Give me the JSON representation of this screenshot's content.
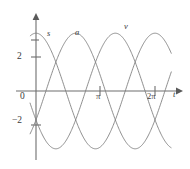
{
  "figure": {
    "title": "",
    "axis": {
      "x_label": "t",
      "y_label": "",
      "x_ticks": [
        {
          "value": "π",
          "pos": 3.14159
        },
        {
          "value": "2π",
          "pos": 6.28318
        }
      ],
      "y_ticks": [
        {
          "value": "2",
          "pos": 2
        },
        {
          "value": "0",
          "pos": 0
        },
        {
          "value": "−2",
          "pos": -2
        }
      ]
    },
    "curve_labels": [
      {
        "name": "s",
        "text": "s"
      },
      {
        "name": "a",
        "text": "a"
      },
      {
        "name": "v",
        "text": "v"
      }
    ],
    "colors": {
      "axis": "#6e6e6e",
      "curve": "#7a7a7a",
      "text": "#3a3a3a",
      "background": "#ffffff"
    }
  },
  "chart_data": {
    "type": "line",
    "title": "",
    "xlabel": "t",
    "ylabel": "",
    "xlim": [
      -0.35,
      7.2
    ],
    "ylim": [
      -4.4,
      4.2
    ],
    "grid": false,
    "legend": "inline-curve-labels",
    "x_tick_values": [
      3.14159,
      6.28318
    ],
    "x_tick_labels": [
      "π",
      "2π"
    ],
    "y_tick_values": [
      2,
      0,
      -2
    ],
    "y_tick_labels": [
      "2",
      "0",
      "−2"
    ],
    "amplitude": 3.4,
    "period": 6.28318,
    "series": [
      {
        "name": "s",
        "label": "s",
        "form": "3.4*cos(t)",
        "phase_deg": 0,
        "x": [
          0,
          0.393,
          0.785,
          1.178,
          1.571,
          1.963,
          2.356,
          2.749,
          3.142,
          3.534,
          3.927,
          4.32,
          4.712,
          5.105,
          5.498,
          5.89,
          6.283,
          6.676,
          7.069
        ],
        "values": [
          3.4,
          3.14,
          2.4,
          1.3,
          0,
          -1.3,
          -2.4,
          -3.14,
          -3.4,
          -3.14,
          -2.4,
          -1.3,
          0,
          1.3,
          2.4,
          3.14,
          3.4,
          3.14,
          2.4
        ]
      },
      {
        "name": "v",
        "label": "v",
        "form": "3.4*cos(t - 2.094)",
        "phase_deg": 120,
        "x": [
          0,
          0.393,
          0.785,
          1.178,
          1.571,
          1.963,
          2.356,
          2.749,
          3.142,
          3.534,
          3.927,
          4.32,
          4.712,
          5.105,
          5.498,
          5.89,
          6.283,
          6.676,
          7.069
        ],
        "values": [
          -1.7,
          -0.61,
          0.61,
          1.7,
          2.54,
          3.18,
          3.4,
          3.18,
          2.54,
          1.7,
          0.61,
          -0.61,
          -1.7,
          -2.54,
          -3.18,
          -3.4,
          -3.18,
          -2.54,
          -1.7
        ]
      },
      {
        "name": "a",
        "label": "a",
        "form": "3.4*cos(t - 4.189)",
        "phase_deg": 240,
        "x": [
          0,
          0.393,
          0.785,
          1.178,
          1.571,
          1.963,
          2.356,
          2.749,
          3.142,
          3.534,
          3.927,
          4.32,
          4.712,
          5.105,
          5.498,
          5.89,
          6.283,
          6.676,
          7.069
        ],
        "values": [
          -1.7,
          -2.54,
          -3.18,
          -3.4,
          -3.18,
          -2.54,
          -1.7,
          -0.61,
          0.61,
          1.7,
          2.54,
          3.18,
          3.4,
          3.18,
          2.54,
          1.7,
          0.61,
          -0.61,
          -1.7
        ]
      }
    ]
  }
}
